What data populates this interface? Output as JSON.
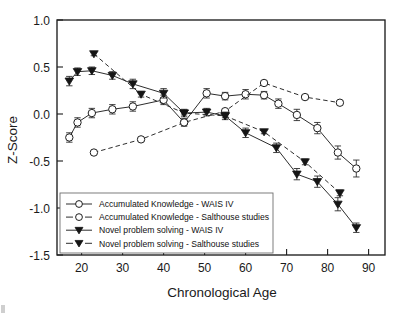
{
  "figure": {
    "background": "#ffffff",
    "ink_color": "#1d1d1d"
  },
  "chart_data": {
    "type": "line",
    "title": "",
    "xlabel": "Chronological Age",
    "ylabel": "Z-Score",
    "xlim": [
      14,
      94
    ],
    "ylim": [
      -1.5,
      1.0
    ],
    "xticks": [
      20,
      30,
      40,
      50,
      60,
      70,
      80,
      90
    ],
    "xtick_labels": [
      "20",
      "30",
      "40",
      "50",
      "60",
      "70",
      "80",
      "90"
    ],
    "yticks": [
      1.0,
      0.5,
      0.0,
      -0.5,
      -1.0,
      -1.5
    ],
    "ytick_labels": [
      "1.0",
      "0.5",
      "0.0",
      "-0.5",
      "-1.0",
      "-1.5"
    ],
    "grid": false,
    "legend_position": "lower-left-inside",
    "error_bars": "standard error",
    "series": [
      {
        "name": "Accumulated Knowledge - WAIS IV",
        "line_style": "solid",
        "marker": "open-circle",
        "x": [
          17,
          19,
          22.5,
          27.5,
          32.5,
          40,
          45,
          50.5,
          55,
          60,
          64.5,
          68,
          72.5,
          77.5,
          82.5,
          87
        ],
        "y": [
          -0.25,
          -0.09,
          0.01,
          0.05,
          0.08,
          0.15,
          -0.09,
          0.22,
          0.19,
          0.21,
          0.2,
          0.11,
          -0.01,
          -0.15,
          -0.41,
          -0.58
        ],
        "yerr": [
          0.05,
          0.05,
          0.05,
          0.05,
          0.05,
          0.05,
          0.04,
          0.05,
          0.04,
          0.05,
          0.04,
          0.05,
          0.06,
          0.06,
          0.07,
          0.09
        ]
      },
      {
        "name": "Accumulated Knowledge - Salthouse studies",
        "line_style": "dashed",
        "marker": "open-circle",
        "x": [
          23,
          34.5,
          45,
          55,
          64.5,
          74.5,
          83
        ],
        "y": [
          -0.41,
          -0.27,
          -0.09,
          0.03,
          0.33,
          0.18,
          0.12
        ],
        "yerr": [
          0.02,
          0.02,
          0.02,
          0.02,
          0.02,
          0.02,
          0.02
        ]
      },
      {
        "name": "Novel problem solving - WAIS IV",
        "line_style": "solid",
        "marker": "filled-triangle-down",
        "x": [
          17,
          19,
          22.5,
          27.5,
          32.5,
          40,
          45,
          50.5,
          55,
          60,
          67.5,
          72.5,
          77.5,
          82.5,
          87
        ],
        "y": [
          0.35,
          0.45,
          0.46,
          0.41,
          0.32,
          0.22,
          0.01,
          0.02,
          -0.02,
          -0.2,
          -0.36,
          -0.64,
          -0.72,
          -0.96,
          -1.21
        ],
        "yerr": [
          0.05,
          0.04,
          0.04,
          0.04,
          0.05,
          0.05,
          0.04,
          0.04,
          0.04,
          0.05,
          0.05,
          0.06,
          0.06,
          0.07,
          0.05
        ]
      },
      {
        "name": "Novel problem solving - Salthouse studies",
        "line_style": "dashed",
        "marker": "filled-triangle-down",
        "x": [
          23,
          34.5,
          45,
          55,
          64.5,
          74.5,
          83
        ],
        "y": [
          0.64,
          0.21,
          0.01,
          -0.02,
          -0.19,
          -0.51,
          -0.84
        ],
        "yerr": [
          0.02,
          0.03,
          0.02,
          0.02,
          0.02,
          0.03,
          0.03
        ]
      }
    ],
    "legend": [
      {
        "label": "Accumulated Knowledge - WAIS IV",
        "line_style": "solid",
        "marker": "open-circle"
      },
      {
        "label": "Accumulated Knowledge - Salthouse studies",
        "line_style": "dashed",
        "marker": "open-circle"
      },
      {
        "label": "Novel problem solving - WAIS IV",
        "line_style": "solid",
        "marker": "filled-triangle-down"
      },
      {
        "label": "Novel problem solving - Salthouse studies",
        "line_style": "dashed",
        "marker": "filled-triangle-down"
      }
    ]
  }
}
